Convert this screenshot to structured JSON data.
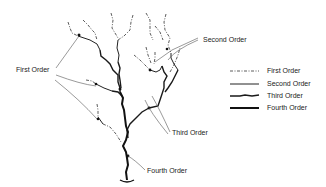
{
  "diagram": {
    "callouts": {
      "first_order": "First Order",
      "second_order": "Second Order",
      "third_order": "Third Order",
      "fourth_order": "Fourth Order"
    },
    "legend": {
      "items": [
        {
          "label": "First Order",
          "style": "dash-dot thin"
        },
        {
          "label": "Second Order",
          "style": "solid thin"
        },
        {
          "label": "Third Order",
          "style": "wavy medium"
        },
        {
          "label": "Fourth Order",
          "style": "solid thick"
        }
      ]
    },
    "colors": {
      "stroke": "#222222",
      "leader": "#555555",
      "background": "#ffffff"
    }
  }
}
